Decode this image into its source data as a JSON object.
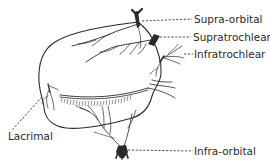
{
  "diagram": {
    "colors": {
      "ink": "#2a2a2a",
      "background": "#ffffff"
    },
    "labels": {
      "supra_orbital": "Supra-orbital",
      "supratrochlear": "Supratrochlear",
      "infratrochlear": "Infratrochlear",
      "lacrimal": "Lacrimal",
      "infra_orbital": "Infra-orbital"
    }
  }
}
